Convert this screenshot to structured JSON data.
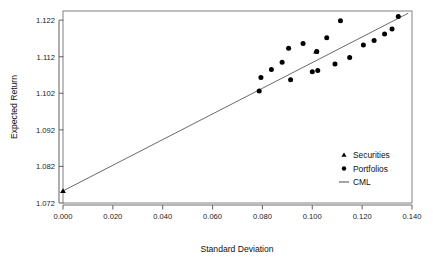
{
  "chart_data": {
    "type": "scatter",
    "title": "",
    "xlabel": "Standard Deviation",
    "ylabel": "Expected Return",
    "xlim": [
      0.0,
      0.14
    ],
    "ylim": [
      1.072,
      1.1245
    ],
    "xticks": [
      0.0,
      0.02,
      0.04,
      0.06,
      0.08,
      0.1,
      0.12,
      0.14
    ],
    "xtick_labels": [
      "0.000",
      "0.020",
      "0.040",
      "0.060",
      "0.080",
      "0.100",
      "0.120",
      "0.140"
    ],
    "yticks": [
      1.072,
      1.082,
      1.092,
      1.102,
      1.112,
      1.122
    ],
    "ytick_labels": [
      "1.072",
      "1.082",
      "1.092",
      "1.102",
      "1.112",
      "1.122"
    ],
    "grid": false,
    "frame": true,
    "legend_position": "center-right",
    "series": [
      {
        "name": "Securities",
        "marker": "triangle",
        "color": "#000000",
        "points": [
          {
            "x": 0.0,
            "y": 1.0753
          },
          {
            "x": 0.1015,
            "y": 1.1134
          }
        ]
      },
      {
        "name": "Portfolios",
        "marker": "circle",
        "color": "#000000",
        "points": [
          {
            "x": 0.0787,
            "y": 1.1026
          },
          {
            "x": 0.0794,
            "y": 1.1063
          },
          {
            "x": 0.0836,
            "y": 1.1085
          },
          {
            "x": 0.0879,
            "y": 1.1105
          },
          {
            "x": 0.0905,
            "y": 1.1143
          },
          {
            "x": 0.0913,
            "y": 1.1057
          },
          {
            "x": 0.0963,
            "y": 1.1156
          },
          {
            "x": 0.1,
            "y": 1.1079
          },
          {
            "x": 0.1018,
            "y": 1.1134
          },
          {
            "x": 0.1022,
            "y": 1.1082
          },
          {
            "x": 0.1058,
            "y": 1.1172
          },
          {
            "x": 0.1091,
            "y": 1.11
          },
          {
            "x": 0.1113,
            "y": 1.1218
          },
          {
            "x": 0.115,
            "y": 1.1118
          },
          {
            "x": 0.1205,
            "y": 1.1152
          },
          {
            "x": 0.1248,
            "y": 1.1164
          },
          {
            "x": 0.129,
            "y": 1.1182
          },
          {
            "x": 0.132,
            "y": 1.1196
          },
          {
            "x": 0.1345,
            "y": 1.123
          }
        ]
      }
    ],
    "lines": [
      {
        "name": "CML",
        "color": "#5a5a5a",
        "from": {
          "x": 0.0,
          "y": 1.0753
        },
        "to": {
          "x": 0.1385,
          "y": 1.1239
        }
      }
    ],
    "legend_entries": [
      {
        "label": "Securities",
        "marker": "triangle"
      },
      {
        "label": "Portfolios",
        "marker": "circle"
      },
      {
        "label": "CML",
        "marker": "line"
      }
    ]
  },
  "axis": {
    "x_title": "Standard Deviation",
    "y_title": "Expected Return"
  }
}
